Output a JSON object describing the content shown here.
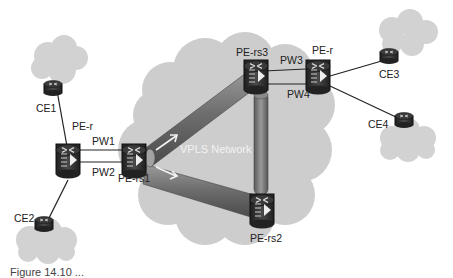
{
  "figure": {
    "network_label": "VPLS Network",
    "caption": "Figure 14.10 ..."
  },
  "nodes": {
    "ce1": "CE1",
    "ce2": "CE2",
    "ce3": "CE3",
    "ce4": "CE4",
    "pe_r_left": "PE-r",
    "pe_r_right": "PE-r",
    "pe_rs1": "PE-rs1",
    "pe_rs2": "PE-rs2",
    "pe_rs3": "PE-rs3"
  },
  "links": {
    "pw1": "PW1",
    "pw2": "PW2",
    "pw3": "PW3",
    "pw4": "PW4"
  },
  "colors": {
    "cloud": "#cfcfcf",
    "tunnel": "#7a7a7a",
    "router": "#2b2b2b"
  }
}
